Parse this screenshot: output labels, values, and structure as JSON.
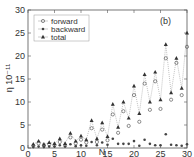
{
  "chart_data": {
    "type": "line",
    "title": "",
    "panel_label": "(b)",
    "xlabel": "N",
    "ylabel": "η 10⁻¹¹",
    "xlim": [
      0,
      30
    ],
    "ylim": [
      0,
      30
    ],
    "xticks": [
      0,
      5,
      10,
      15,
      20,
      25,
      30
    ],
    "yticks": [
      0,
      5,
      10,
      15,
      20,
      25,
      30
    ],
    "grid": false,
    "legend_position": "upper left",
    "x": [
      1,
      2,
      3,
      4,
      5,
      6,
      7,
      8,
      9,
      10,
      11,
      12,
      13,
      14,
      15,
      16,
      17,
      18,
      19,
      20,
      21,
      22,
      23,
      24,
      25,
      26,
      27,
      28,
      29,
      30
    ],
    "series": [
      {
        "name": "forward",
        "marker": "circle-plus",
        "values": [
          0.5,
          1.0,
          0.5,
          0.8,
          0.6,
          1.3,
          0.6,
          2.3,
          1.0,
          1.8,
          1.2,
          4.3,
          1.3,
          4.0,
          1.7,
          7.3,
          3.3,
          8.0,
          4.8,
          11.5,
          5.7,
          14.0,
          8.3,
          14.5,
          8.5,
          19.5,
          10.5,
          18.5,
          11.5,
          22.0
        ]
      },
      {
        "name": "backward",
        "marker": "dot",
        "values": [
          0.2,
          0.3,
          0.2,
          0.3,
          0.3,
          0.6,
          0.3,
          0.8,
          0.4,
          0.6,
          0.5,
          1.3,
          0.6,
          1.2,
          0.7,
          2.0,
          0.9,
          0.9,
          0.9,
          1.5,
          0.5,
          1.8,
          0.9,
          0.6,
          0.6,
          3.0,
          0.7,
          0.6,
          0.5,
          0.8
        ]
      },
      {
        "name": "total",
        "marker": "triangle",
        "line": "dotted",
        "values": [
          0.8,
          1.5,
          0.8,
          1.2,
          1.0,
          2.0,
          1.0,
          3.2,
          1.5,
          2.6,
          1.8,
          6.0,
          2.0,
          5.5,
          2.5,
          9.5,
          4.5,
          10.0,
          6.5,
          13.5,
          7.5,
          16.0,
          10.0,
          16.5,
          10.5,
          22.5,
          12.0,
          19.5,
          13.0,
          25.0
        ]
      }
    ]
  }
}
